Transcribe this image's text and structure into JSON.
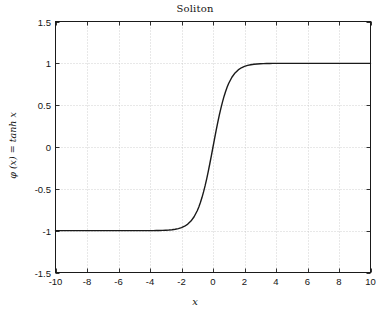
{
  "chart_data": {
    "type": "line",
    "title": "Soliton",
    "xlabel": "x",
    "ylabel": "φ (x) = tanh x",
    "xlim": [
      -10,
      10
    ],
    "ylim": [
      -1.5,
      1.5
    ],
    "grid": true,
    "legend": null,
    "xticks": [
      -10,
      -8,
      -6,
      -4,
      -2,
      0,
      2,
      4,
      6,
      8,
      10
    ],
    "xticklabels": [
      "-10",
      "-8",
      "-6",
      "-4",
      "-2",
      "0",
      "2",
      "4",
      "6",
      "8",
      "10"
    ],
    "yticks": [
      -1.5,
      -1,
      -0.5,
      0,
      0.5,
      1,
      1.5
    ],
    "yticklabels": [
      "-1.5",
      "-1",
      "-0.5",
      "0",
      "0.5",
      "1",
      "1.5"
    ],
    "series": [
      {
        "name": "tanh x",
        "color": "#1a1a1a",
        "linewidth": 1.4,
        "x": [
          -10,
          -9.5,
          -9,
          -8.5,
          -8,
          -7.5,
          -7,
          -6.5,
          -6,
          -5.5,
          -5,
          -4.5,
          -4,
          -3.8,
          -3.6,
          -3.4,
          -3.2,
          -3,
          -2.8,
          -2.6,
          -2.4,
          -2.2,
          -2,
          -1.8,
          -1.6,
          -1.4,
          -1.2,
          -1,
          -0.9,
          -0.8,
          -0.7,
          -0.6,
          -0.5,
          -0.4,
          -0.3,
          -0.2,
          -0.1,
          0,
          0.1,
          0.2,
          0.3,
          0.4,
          0.5,
          0.6,
          0.7,
          0.8,
          0.9,
          1,
          1.2,
          1.4,
          1.6,
          1.8,
          2,
          2.2,
          2.4,
          2.6,
          2.8,
          3,
          3.2,
          3.4,
          3.6,
          3.8,
          4,
          4.5,
          5,
          5.5,
          6,
          6.5,
          7,
          7.5,
          8,
          8.5,
          9,
          9.5,
          10
        ],
        "y": [
          -1,
          -1,
          -1,
          -1,
          -1,
          -1,
          -1,
          -1,
          -0.99999,
          -0.99997,
          -0.9999,
          -0.99975,
          -0.99933,
          -0.999,
          -0.99851,
          -0.99778,
          -0.99668,
          -0.99505,
          -0.99263,
          -0.98903,
          -0.98367,
          -0.97574,
          -0.96403,
          -0.94681,
          -0.92167,
          -0.88535,
          -0.83365,
          -0.76159,
          -0.7163,
          -0.66404,
          -0.60437,
          -0.53705,
          -0.46212,
          -0.37995,
          -0.29131,
          -0.19738,
          -0.09967,
          0,
          0.09967,
          0.19738,
          0.29131,
          0.37995,
          0.46212,
          0.53705,
          0.60437,
          0.66404,
          0.7163,
          0.76159,
          0.83365,
          0.88535,
          0.92167,
          0.94681,
          0.96403,
          0.97574,
          0.98367,
          0.98903,
          0.99263,
          0.99505,
          0.99668,
          0.99778,
          0.99851,
          0.999,
          0.99933,
          0.99975,
          0.9999,
          0.99997,
          0.99999,
          1,
          1,
          1,
          1,
          1,
          1,
          1,
          1
        ]
      }
    ]
  },
  "axes": {
    "frame_color": "#1a1a1a",
    "grid_color": "#bfbfbf",
    "background": "#ffffff"
  }
}
